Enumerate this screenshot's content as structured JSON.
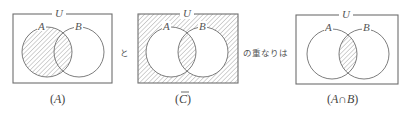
{
  "diagrams": [
    {
      "id": "A",
      "universe_label": "U",
      "set_labels": [
        "A",
        "B"
      ],
      "shaded_region": "A",
      "caption_open": "(",
      "caption_main": "A",
      "caption_close": ")"
    },
    {
      "id": "C-bar",
      "universe_label": "U",
      "set_labels": [
        "A",
        "B"
      ],
      "shaded_region": "complement of C (outside union plus A∩B)",
      "caption_open": "(",
      "caption_main": "C",
      "caption_close": ")",
      "caption_overline": true
    },
    {
      "id": "A-cap-B",
      "universe_label": "U",
      "set_labels": [
        "A",
        "B"
      ],
      "shaded_region": "A∩B",
      "caption_open": "(",
      "caption_main": "A∩B",
      "caption_close": ")"
    }
  ],
  "connectors": {
    "and": "と",
    "overlap_is": "の重なりは"
  },
  "colors": {
    "line": "#6e6e6e",
    "hatch": "#9a9a9a",
    "background": "#ffffff"
  }
}
